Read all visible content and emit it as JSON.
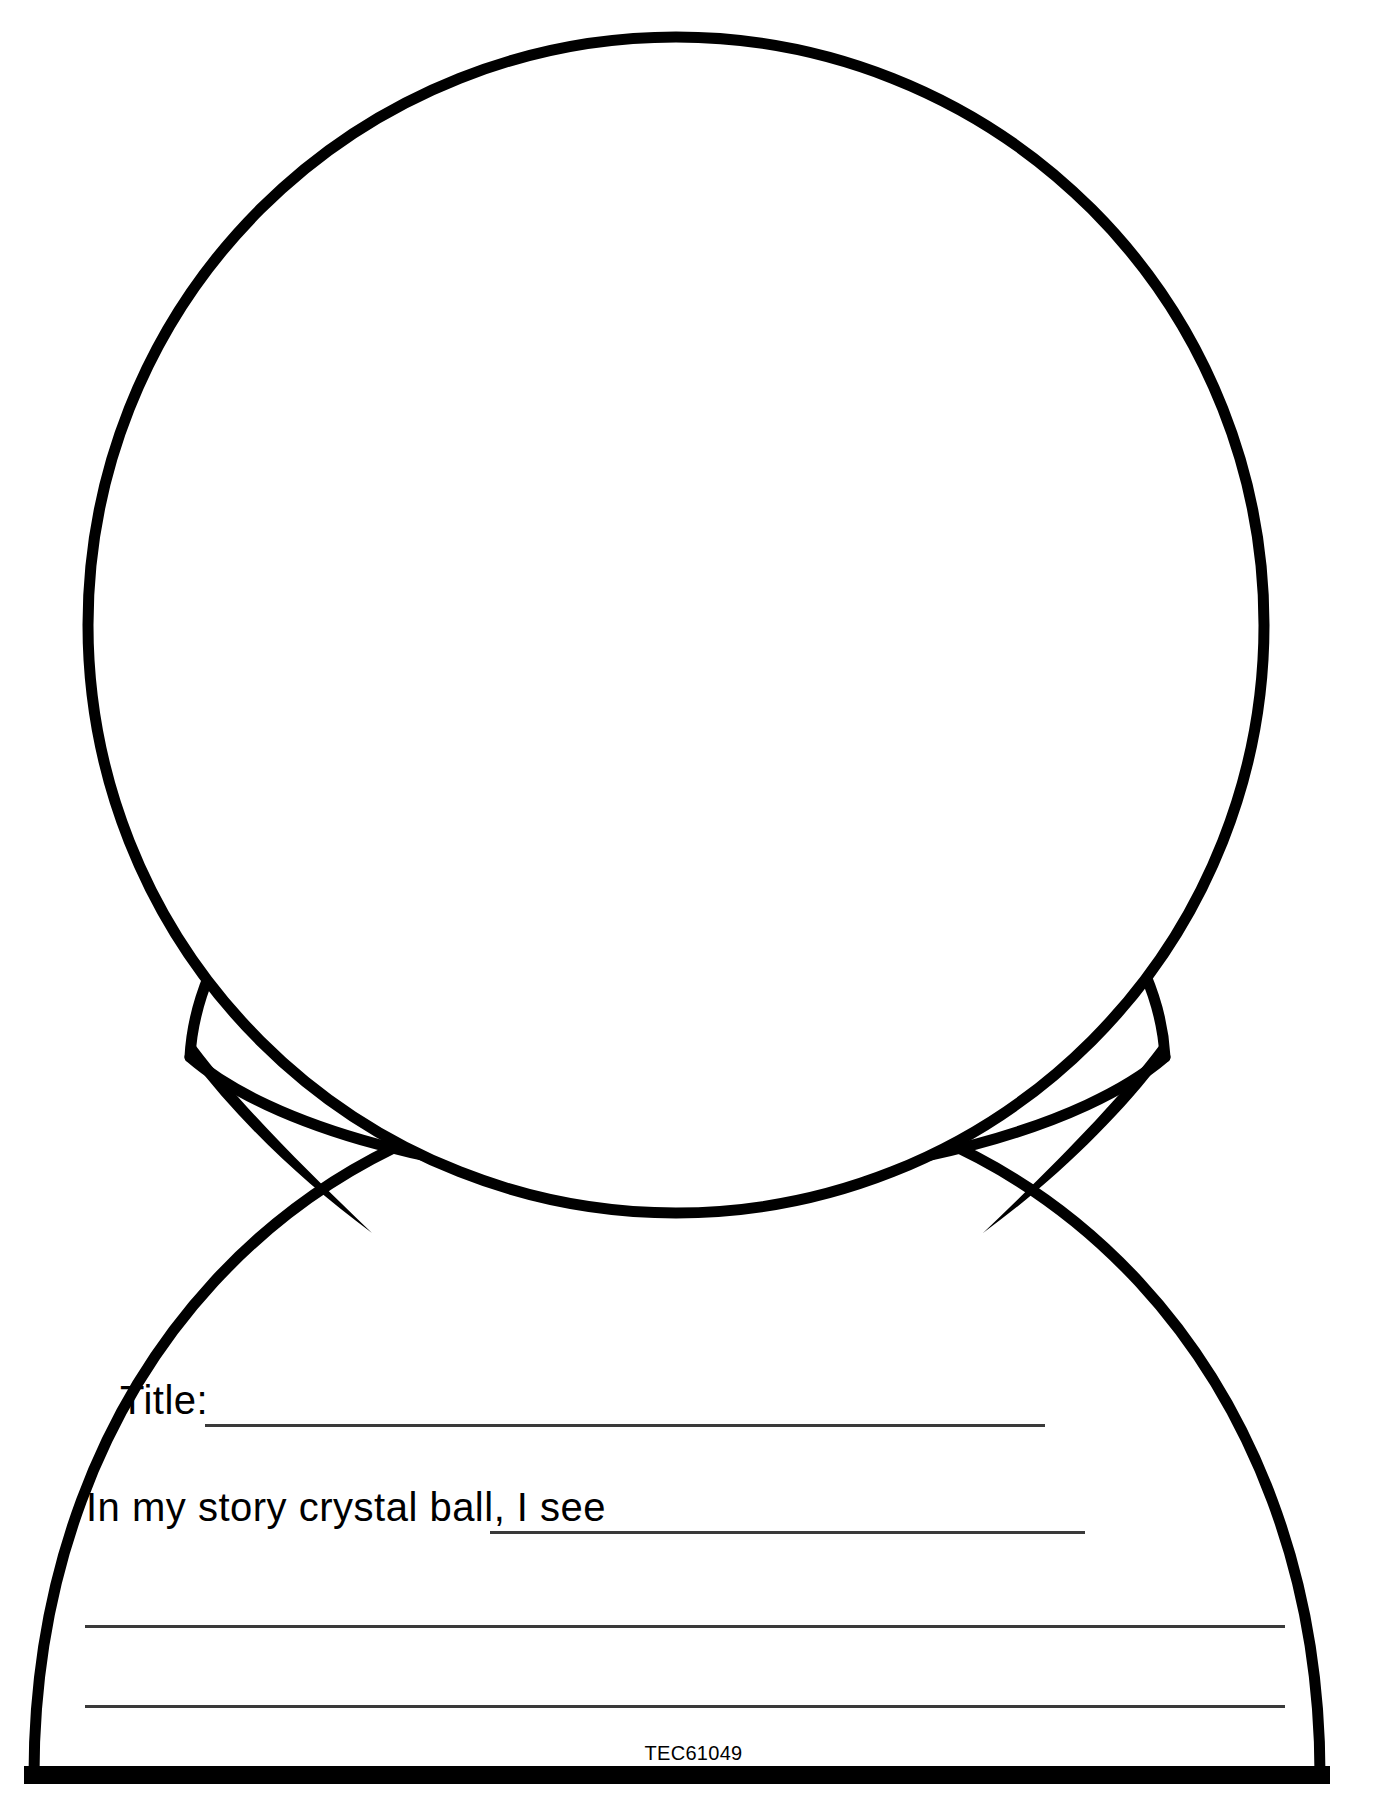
{
  "page": {
    "kind": "printable-worksheet",
    "background_color": "#ffffff",
    "ink_color": "#000000",
    "rule_color": "#3a3a3a",
    "width": 1387,
    "height": 1820
  },
  "artwork": {
    "name": "story-crystal-ball",
    "parts": [
      {
        "name": "crystal-ball-sphere",
        "shape": "circle",
        "cx": 676,
        "cy": 625,
        "r": 588
      },
      {
        "name": "ball-collar",
        "shape": "collar-band"
      },
      {
        "name": "stand-base",
        "shape": "dome-base"
      }
    ]
  },
  "form": {
    "title_label": "Title:",
    "title_value": "",
    "title_placeholder": "",
    "prompt_label": "In my story crystal ball, I see",
    "prompt_value": "",
    "prompt_placeholder": "",
    "extra_line_values": [
      "",
      ""
    ]
  },
  "footer": {
    "code": "TEC61049"
  }
}
